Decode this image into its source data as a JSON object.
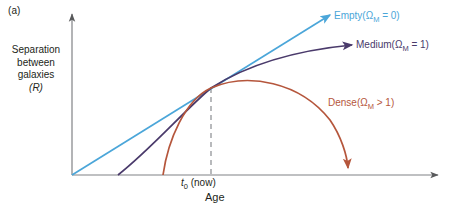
{
  "figure": {
    "panel_label": "(a)",
    "background": "#ffffff"
  },
  "axes": {
    "y_label_lines": [
      "Separation",
      "between",
      "galaxies"
    ],
    "y_label_symbol": "(R)",
    "x_title": "Age",
    "x_tick_symbol": "t",
    "x_tick_subscript": "0",
    "x_tick_suffix": " (now)",
    "axis_color": "#808285",
    "origin_x": 72,
    "origin_y": 175,
    "x_axis_end": 443,
    "y_axis_top": 10
  },
  "chart_data": {
    "type": "line",
    "title": "",
    "xlabel": "Age",
    "ylabel": "Separation between galaxies (R)",
    "grid": false,
    "legend": "inline-labels",
    "annotations": [
      {
        "name": "present-epoch",
        "x_label": "t0 (now)",
        "x_px": 211,
        "style": "dashed-vertical"
      }
    ],
    "series": [
      {
        "name": "Empty",
        "omega_label": "Empty (ΩM = 0)",
        "omega_value": "ΩM = 0",
        "color": "#4ba6d9",
        "shape": "straight-line",
        "path": "M 72 175 L 330 15",
        "arrow_at": [
          330,
          15
        ],
        "arrow_angle": -31.8,
        "big_bang_x": 72,
        "points": [
          [
            72,
            175
          ],
          [
            140,
            133
          ],
          [
            211,
            88
          ],
          [
            270,
            52
          ],
          [
            330,
            15
          ]
        ]
      },
      {
        "name": "Medium",
        "omega_label": "Medium (ΩM = 1)",
        "omega_value": "ΩM = 1",
        "color": "#4a3a6b",
        "shape": "decelerating-curve",
        "path": "M 118 175 C 150 150, 185 110, 211 88 C 250 63, 300 50, 352 45",
        "arrow_at": [
          352,
          45
        ],
        "arrow_angle": -4.5,
        "big_bang_x": 118,
        "points": [
          [
            118,
            175
          ],
          [
            160,
            140
          ],
          [
            211,
            88
          ],
          [
            280,
            55
          ],
          [
            352,
            45
          ]
        ]
      },
      {
        "name": "Dense",
        "omega_label": "Dense (ΩM > 1)",
        "omega_value": "ΩM > 1",
        "color": "#b5563c",
        "shape": "recollapsing-arc",
        "path": "M 163 175 C 168 140, 185 100, 211 88 C 248 72, 300 82, 330 120 C 341 136, 347 155, 348 168",
        "arrow_at": [
          348,
          172
        ],
        "arrow_angle": 85,
        "big_bang_x": 163,
        "peak": [
          255,
          83
        ],
        "collapse_x": 348,
        "points": [
          [
            163,
            175
          ],
          [
            185,
            104
          ],
          [
            211,
            88
          ],
          [
            255,
            83
          ],
          [
            310,
            105
          ],
          [
            348,
            168
          ]
        ]
      }
    ]
  },
  "labels": {
    "empty": {
      "name": "Empty",
      "omega": "(Ω",
      "sub": "M",
      "rest": " = 0)"
    },
    "medium": {
      "name": "Medium",
      "omega": "(Ω",
      "sub": "M",
      "rest": " = 1)"
    },
    "dense": {
      "name": "Dense",
      "omega": "(Ω",
      "sub": "M",
      "rest": " > 1)"
    }
  }
}
